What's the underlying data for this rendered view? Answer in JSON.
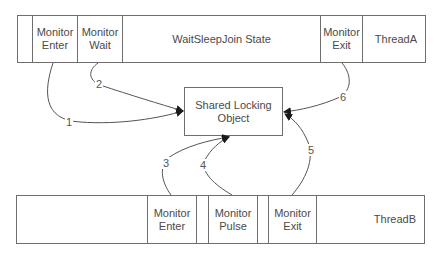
{
  "thread_a": {
    "name": "ThreadA",
    "cells": [
      {
        "label": "",
        "width": 15
      },
      {
        "label": "Monitor\nEnter",
        "width": 45
      },
      {
        "label": "Monitor\nWait",
        "width": 45
      },
      {
        "label": "WaitSleepJoin State",
        "width": 198
      },
      {
        "label": "Monitor\nExit",
        "width": 42
      },
      {
        "label": "ThreadA",
        "width": 63
      }
    ]
  },
  "thread_b": {
    "name": "ThreadB",
    "cells": [
      {
        "label": "",
        "width": 131
      },
      {
        "label": "Monitor\nEnter",
        "width": 49
      },
      {
        "label": "",
        "width": 12
      },
      {
        "label": "Monitor\nPulse",
        "width": 49
      },
      {
        "label": "",
        "width": 11
      },
      {
        "label": "Monitor\nExit",
        "width": 48
      },
      {
        "label": "ThreadB",
        "width": 108
      }
    ]
  },
  "shared_object": {
    "label": "Shared Locking\nObject"
  },
  "arrows": [
    {
      "label": "1",
      "from": "ThreadA Monitor Enter",
      "to": "Shared Locking Object"
    },
    {
      "label": "2",
      "from": "ThreadA Monitor Wait",
      "to": "Shared Locking Object"
    },
    {
      "label": "3",
      "from": "ThreadB Monitor Enter",
      "to": "Shared Locking Object"
    },
    {
      "label": "4",
      "from": "ThreadB Monitor Pulse",
      "to": "Shared Locking Object"
    },
    {
      "label": "5",
      "from": "ThreadB Monitor Exit",
      "to": "Shared Locking Object"
    },
    {
      "label": "6",
      "from": "ThreadA Monitor Exit",
      "to": "Shared Locking Object"
    }
  ],
  "colors": {
    "line": "#6e6e6e",
    "text": "#4a4a4a",
    "arrowhead": "#1a1a1a"
  }
}
